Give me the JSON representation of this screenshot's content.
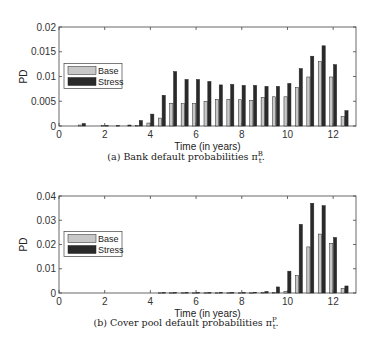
{
  "chart_data": [
    {
      "type": "bar",
      "title": "",
      "caption": "(a) Bank default probabilities π",
      "caption_sub": "t",
      "caption_sup": "B",
      "xlabel": "Time (in years)",
      "ylabel": "PD",
      "xlim": [
        0,
        13
      ],
      "ylim": [
        0,
        0.02
      ],
      "xticks": [
        "0",
        "2",
        "4",
        "6",
        "8",
        "10",
        "12"
      ],
      "yticks": [
        "0",
        "0.005",
        "0.01",
        "0.015",
        "0.02"
      ],
      "legend": {
        "position": "left-middle",
        "entries": [
          "Base",
          "Stress"
        ]
      },
      "grid": false,
      "x": [
        1,
        1.5,
        2,
        2.5,
        3,
        3.5,
        4,
        4.5,
        5,
        5.5,
        6,
        6.5,
        7,
        7.5,
        8,
        8.5,
        9,
        9.5,
        10,
        10.5,
        11,
        11.5,
        12,
        12.5
      ],
      "series": [
        {
          "name": "Base",
          "color": "#c8c8c8",
          "values": [
            0.0002,
            0,
            0.0001,
            0,
            0,
            0.0001,
            0.0006,
            0.0016,
            0.0046,
            0.0045,
            0.0045,
            0.005,
            0.0054,
            0.0054,
            0.0053,
            0.0052,
            0.0058,
            0.0059,
            0.0059,
            0.0078,
            0.0099,
            0.013,
            0.0099,
            0.0019
          ]
        },
        {
          "name": "Stress",
          "color": "#2a2a2a",
          "values": [
            0.0005,
            0,
            0.0001,
            0.0001,
            0.0002,
            0.0011,
            0.0024,
            0.0062,
            0.011,
            0.0094,
            0.0094,
            0.009,
            0.0083,
            0.0084,
            0.0082,
            0.0082,
            0.008,
            0.008,
            0.0086,
            0.0116,
            0.0141,
            0.0162,
            0.0124,
            0.0031
          ]
        }
      ]
    },
    {
      "type": "bar",
      "title": "",
      "caption": "(b) Cover pool default probabilities π",
      "caption_sub": "t",
      "caption_sup": "P",
      "xlabel": "Time (in years)",
      "ylabel": "PD",
      "xlim": [
        0,
        13
      ],
      "ylim": [
        0,
        0.04
      ],
      "xticks": [
        "0",
        "2",
        "4",
        "6",
        "8",
        "10",
        "12"
      ],
      "yticks": [
        "0",
        "0.01",
        "0.02",
        "0.03",
        "0.04"
      ],
      "legend": {
        "position": "left-middle",
        "entries": [
          "Base",
          "Stress"
        ]
      },
      "grid": false,
      "x": [
        1,
        1.5,
        2,
        2.5,
        3,
        3.5,
        4,
        4.5,
        5,
        5.5,
        6,
        6.5,
        7,
        7.5,
        8,
        8.5,
        9,
        9.5,
        10,
        10.5,
        11,
        11.5,
        12,
        12.5
      ],
      "series": [
        {
          "name": "Base",
          "color": "#c8c8c8",
          "values": [
            0,
            0,
            0,
            0,
            0,
            0,
            0,
            0.0001,
            0.0001,
            0.0001,
            0.0001,
            0.0001,
            0.0001,
            0.0001,
            0.0001,
            0.0001,
            0.0002,
            0.0002,
            0.0006,
            0.0072,
            0.019,
            0.0243,
            0.0205,
            0.0018
          ]
        },
        {
          "name": "Stress",
          "color": "#2a2a2a",
          "values": [
            0,
            0,
            0,
            0,
            0,
            0,
            0,
            0.0002,
            0.0002,
            0.0002,
            0.0002,
            0.0002,
            0.0002,
            0.0002,
            0.0002,
            0.0003,
            0.0006,
            0.0025,
            0.009,
            0.0283,
            0.037,
            0.036,
            0.0229,
            0.0029
          ]
        }
      ]
    }
  ]
}
